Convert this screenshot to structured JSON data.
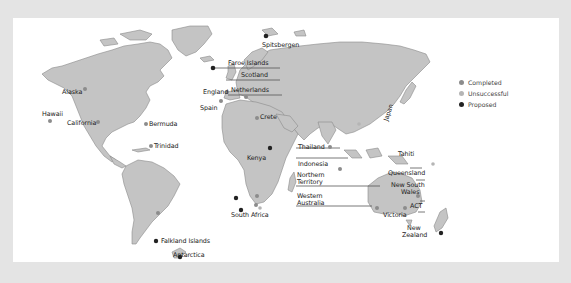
{
  "map": {
    "title": "World map of sites",
    "colors": {
      "frame": "#e4e4e4",
      "panel": "#ffffff",
      "land": "#c4c4c4",
      "coast": "#8a8a8a",
      "completed": "#8c8c8c",
      "unsuccessful": "#b5b5b5",
      "proposed": "#222222"
    },
    "legend": [
      {
        "label": "Completed",
        "status": "completed"
      },
      {
        "label": "Unsuccessful",
        "status": "unsuccessful"
      },
      {
        "label": "Proposed",
        "status": "proposed"
      }
    ],
    "labels": {
      "spitsbergen": "Spitsbergen",
      "faroe": "Faroe Islands",
      "scotland": "Scotland",
      "england": "England",
      "netherlands": "Netherlands",
      "spain": "Spain",
      "crete": "Crete",
      "alaska": "Alaska",
      "hawaii": "Hawaii",
      "california": "California",
      "bermuda": "Bermuda",
      "trinidad": "Trinidad",
      "japan": "Japan",
      "thailand": "Thailand",
      "indonesia": "Indonesia",
      "northern_territory_1": "Northern",
      "northern_territory_2": "Territory",
      "western_australia_1": "Western",
      "western_australia_2": "Australia",
      "kenya": "Kenya",
      "south_africa": "South Africa",
      "tahiti": "Tahiti",
      "queensland": "Queensland",
      "nsw_1": "New South",
      "nsw_2": "Wales",
      "act": "ACT",
      "victoria": "Victoria",
      "new_zealand_1": "New",
      "new_zealand_2": "Zealand",
      "falkland": "Falkland Islands",
      "antarctica": "Antarctica"
    }
  }
}
